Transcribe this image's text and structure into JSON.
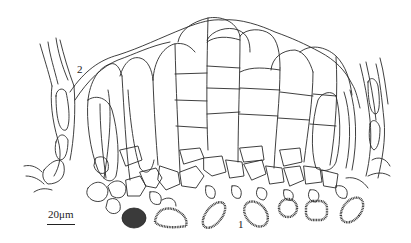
{
  "figure": {
    "labels": {
      "panel_2": "2",
      "panel_1": "1"
    },
    "scale_bar": {
      "text": "20μm"
    },
    "colors": {
      "line": "#2a2a2a",
      "background": "#ffffff"
    },
    "spores_count": 7
  }
}
